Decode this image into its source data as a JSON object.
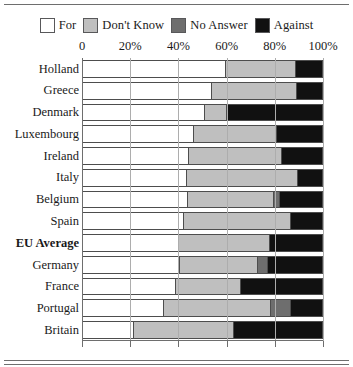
{
  "legend": {
    "entries": [
      {
        "label": "For",
        "color": "#ffffff",
        "key": "for"
      },
      {
        "label": "Don't Know",
        "color": "#bfbfbf",
        "key": "dont_know"
      },
      {
        "label": "No Answer",
        "color": "#6e6e6e",
        "key": "no_answer"
      },
      {
        "label": "Against",
        "color": "#111111",
        "key": "against"
      }
    ]
  },
  "chart_data": {
    "type": "bar",
    "orientation": "horizontal",
    "stacked": true,
    "normalized_percent": true,
    "title": "",
    "subtitle": "",
    "xlabel": "",
    "ylabel": "",
    "xlim": [
      0,
      100
    ],
    "grid": true,
    "legend_position": "top",
    "xticks": [
      0,
      20,
      40,
      60,
      80,
      100
    ],
    "xtick_labels": [
      "0",
      "20%",
      "40%",
      "60%",
      "80%",
      "100%"
    ],
    "categories": [
      "Holland",
      "Greece",
      "Denmark",
      "Luxembourg",
      "Ireland",
      "Italy",
      "Belgium",
      "Spain",
      "EU Average",
      "Germany",
      "France",
      "Portugal",
      "Britain"
    ],
    "emphasized_categories": [
      "EU Average"
    ],
    "series": [
      {
        "name": "For",
        "color": "#ffffff",
        "values": [
          60,
          54,
          51,
          46.5,
          44.5,
          43.5,
          44,
          42,
          40,
          40.5,
          39,
          34,
          21
        ]
      },
      {
        "name": "Don't Know",
        "color": "#bfbfbf",
        "values": [
          29,
          35.5,
          9,
          34.5,
          38.5,
          46.5,
          36,
          45,
          38,
          33,
          27,
          45,
          42
        ]
      },
      {
        "name": "No Answer",
        "color": "#6e6e6e",
        "values": [
          0,
          0,
          0,
          0,
          0,
          0,
          2,
          0,
          0,
          3.5,
          0,
          8,
          0
        ]
      },
      {
        "name": "Against",
        "color": "#111111",
        "values": [
          11,
          10.5,
          40,
          19,
          17,
          10,
          18,
          13,
          22,
          23,
          34,
          13,
          37
        ]
      }
    ]
  }
}
